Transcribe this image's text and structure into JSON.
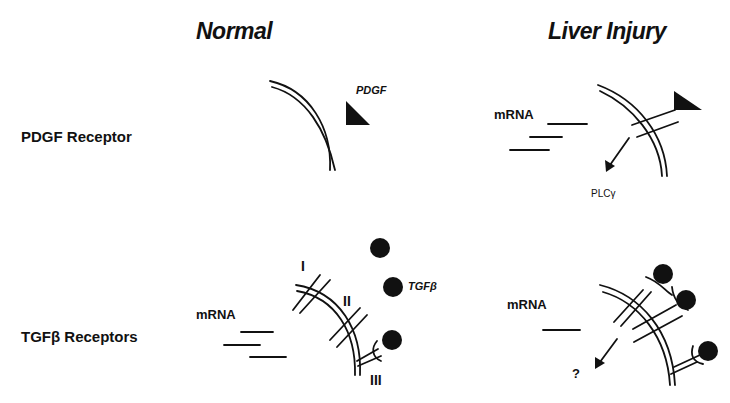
{
  "columns": {
    "normal": "Normal",
    "injury": "Liver Injury"
  },
  "rows": {
    "pdgf": "PDGF Receptor",
    "tgfb": "TGFβ Receptors"
  },
  "labels": {
    "pdgf_ligand": "PDGF",
    "tgfb_ligand": "TGFβ",
    "mrna_pdgf_injury": "mRNA",
    "mrna_tgfb_normal": "mRNA",
    "mrna_tgfb_injury": "mRNA",
    "plc": "PLCγ",
    "unknown": "?",
    "receptor_I": "I",
    "receptor_II": "II",
    "receptor_III": "III"
  },
  "colors": {
    "ink": "#111111",
    "background": "#ffffff"
  }
}
